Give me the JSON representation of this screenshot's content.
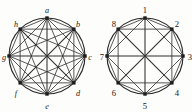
{
  "figure": {
    "background_color": "#fdfdfc",
    "stroke_color": "#2b2b2b",
    "vertex_color": "#1d1d1d",
    "panels": [
      {
        "id": "left-graph",
        "name": "complete-graph-k8",
        "center_x": 47,
        "center_y": 56,
        "radius": 38,
        "vertex_count": 8,
        "label_style": "italic-letters",
        "labels": [
          "a",
          "b",
          "c",
          "d",
          "e",
          "f",
          "g",
          "h"
        ],
        "label_positions": [
          {
            "label": "a",
            "x": 47,
            "y": 11,
            "anchor": "middle"
          },
          {
            "label": "b",
            "x": 78,
            "y": 25,
            "anchor": "middle"
          },
          {
            "label": "c",
            "x": 90,
            "y": 58,
            "anchor": "middle"
          },
          {
            "label": "d",
            "x": 78,
            "y": 94,
            "anchor": "middle"
          },
          {
            "label": "e",
            "x": 47,
            "y": 107,
            "anchor": "middle"
          },
          {
            "label": "f",
            "x": 16,
            "y": 94,
            "anchor": "middle"
          },
          {
            "label": "g",
            "x": 4,
            "y": 58,
            "anchor": "middle"
          },
          {
            "label": "h",
            "x": 16,
            "y": 25,
            "anchor": "middle"
          }
        ],
        "edges": [
          [
            0,
            1
          ],
          [
            0,
            2
          ],
          [
            0,
            3
          ],
          [
            0,
            4
          ],
          [
            0,
            5
          ],
          [
            0,
            6
          ],
          [
            0,
            7
          ],
          [
            1,
            2
          ],
          [
            1,
            3
          ],
          [
            1,
            4
          ],
          [
            1,
            5
          ],
          [
            1,
            6
          ],
          [
            1,
            7
          ],
          [
            2,
            3
          ],
          [
            2,
            4
          ],
          [
            2,
            5
          ],
          [
            2,
            6
          ],
          [
            2,
            7
          ],
          [
            3,
            4
          ],
          [
            3,
            5
          ],
          [
            3,
            6
          ],
          [
            3,
            7
          ],
          [
            4,
            5
          ],
          [
            4,
            6
          ],
          [
            4,
            7
          ],
          [
            5,
            6
          ],
          [
            5,
            7
          ],
          [
            6,
            7
          ]
        ],
        "edge_count": 28
      },
      {
        "id": "right-graph",
        "name": "circulant-graph-8",
        "center_x": 145,
        "center_y": 56,
        "radius": 38,
        "vertex_count": 8,
        "label_style": "numerals",
        "labels": [
          "1",
          "2",
          "3",
          "4",
          "5",
          "6",
          "7",
          "8"
        ],
        "label_positions": [
          {
            "label": "1",
            "x": 145,
            "y": 11,
            "anchor": "middle"
          },
          {
            "label": "2",
            "x": 177,
            "y": 25,
            "anchor": "middle"
          },
          {
            "label": "3",
            "x": 190,
            "y": 58,
            "anchor": "middle"
          },
          {
            "label": "4",
            "x": 177,
            "y": 94,
            "anchor": "middle"
          },
          {
            "label": "5",
            "x": 145,
            "y": 107,
            "anchor": "middle"
          },
          {
            "label": "6",
            "x": 114,
            "y": 94,
            "anchor": "middle"
          },
          {
            "label": "7",
            "x": 102,
            "y": 58,
            "anchor": "middle"
          },
          {
            "label": "8",
            "x": 114,
            "y": 25,
            "anchor": "middle"
          }
        ],
        "edges": [
          [
            0,
            1
          ],
          [
            1,
            2
          ],
          [
            2,
            3
          ],
          [
            3,
            4
          ],
          [
            4,
            5
          ],
          [
            5,
            6
          ],
          [
            6,
            7
          ],
          [
            7,
            0
          ],
          [
            0,
            2
          ],
          [
            1,
            3
          ],
          [
            2,
            4
          ],
          [
            3,
            5
          ],
          [
            4,
            6
          ],
          [
            5,
            7
          ],
          [
            6,
            0
          ],
          [
            7,
            1
          ],
          [
            0,
            4
          ],
          [
            1,
            5
          ],
          [
            2,
            6
          ],
          [
            3,
            7
          ]
        ],
        "edge_count": 20
      }
    ]
  }
}
